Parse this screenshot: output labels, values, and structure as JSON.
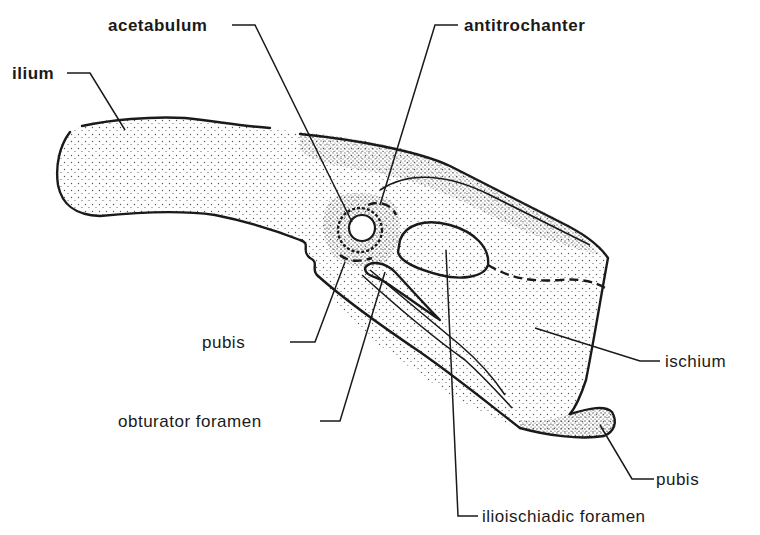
{
  "diagram": {
    "colors": {
      "ink": "#1a1a1a",
      "background": "#ffffff",
      "stipple": "#555555"
    },
    "labels": {
      "acetabulum": "acetabulum",
      "antitrochanter": "antitrochanter",
      "ilium": "ilium",
      "pubis_upper": "pubis",
      "obturator_foramen": "obturator foramen",
      "ischium": "ischium",
      "pubis_lower": "pubis",
      "ilioischiadic_foramen": "ilioischiadic foramen"
    },
    "leaders": [
      {
        "label": "acetabulum",
        "text_pos": [
          108,
          30
        ],
        "points": [
          [
            232,
            25
          ],
          [
            255,
            25
          ],
          [
            352,
            222
          ]
        ]
      },
      {
        "label": "antitrochanter",
        "text_pos": [
          464,
          30
        ],
        "points": [
          [
            458,
            25
          ],
          [
            435,
            25
          ],
          [
            380,
            205
          ]
        ]
      },
      {
        "label": "ilium",
        "text_pos": [
          12,
          78
        ],
        "points": [
          [
            67,
            73
          ],
          [
            90,
            73
          ],
          [
            125,
            130
          ]
        ]
      },
      {
        "label": "pubis",
        "text_pos": [
          202,
          347
        ],
        "points": [
          [
            290,
            342
          ],
          [
            315,
            342
          ],
          [
            345,
            262
          ]
        ]
      },
      {
        "label": "obturator foramen",
        "text_pos": [
          118,
          426
        ],
        "points": [
          [
            320,
            421
          ],
          [
            340,
            421
          ],
          [
            385,
            272
          ]
        ]
      },
      {
        "label": "ischium",
        "text_pos": [
          665,
          366
        ],
        "points": [
          [
            660,
            361
          ],
          [
            640,
            361
          ],
          [
            535,
            328
          ]
        ]
      },
      {
        "label": "pubis",
        "text_pos": [
          656,
          484
        ],
        "points": [
          [
            654,
            479
          ],
          [
            632,
            479
          ],
          [
            600,
            425
          ]
        ]
      },
      {
        "label": "ilioischiadic foramen",
        "text_pos": [
          482,
          522
        ],
        "points": [
          [
            478,
            516
          ],
          [
            458,
            516
          ],
          [
            446,
            250
          ]
        ]
      }
    ]
  }
}
